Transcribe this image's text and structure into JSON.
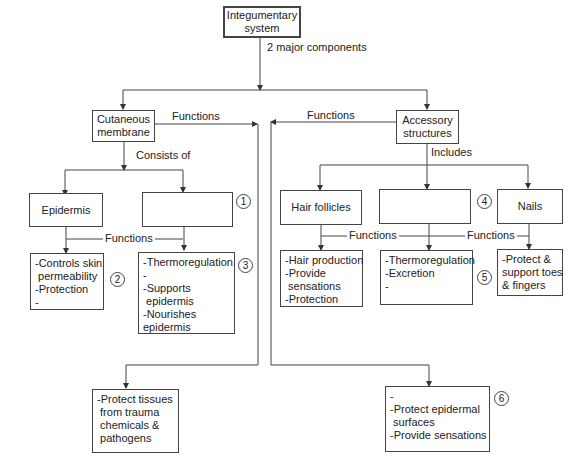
{
  "root": {
    "label": "Integumentary system"
  },
  "root_edge_label": "2 major components",
  "cutaneous": {
    "label": "Cutaneous membrane",
    "edge_label": "Consists of",
    "functions_label": "Functions"
  },
  "accessory": {
    "label": "Accessory structures",
    "edge_label": "Includes",
    "functions_label": "Functions"
  },
  "epidermis": {
    "label": "Epidermis",
    "functions": [
      "-Controls skin",
      " permeability",
      "-Protection",
      "-"
    ],
    "marker": "2"
  },
  "blank1": {
    "label": "",
    "marker": "1",
    "functions": [
      "-Thermoregulation",
      "-",
      "-Supports",
      " epidermis",
      "-Nourishes",
      "epidermis"
    ],
    "functions_marker": "3"
  },
  "left_functions_label": "Functions",
  "hair": {
    "label": "Hair follicles",
    "functions": [
      "-Hair production",
      "-Provide",
      " sensations",
      "-Protection"
    ]
  },
  "blank4": {
    "label": "",
    "marker": "4",
    "functions": [
      "-Thermoregulation",
      "-Excretion",
      "-"
    ],
    "functions_marker": "5"
  },
  "nails": {
    "label": "Nails",
    "functions": [
      "-Protect &",
      "support toes",
      "& fingers"
    ]
  },
  "right_functions_labels": [
    "Functions",
    "Functions"
  ],
  "cutaneous_result": {
    "functions": [
      "-Protect tissues",
      " from trauma",
      " chemicals &",
      " pathogens"
    ]
  },
  "accessory_result": {
    "functions": [
      "-",
      "-Protect epidermal",
      " surfaces",
      "-Provide sensations"
    ],
    "marker": "6"
  }
}
